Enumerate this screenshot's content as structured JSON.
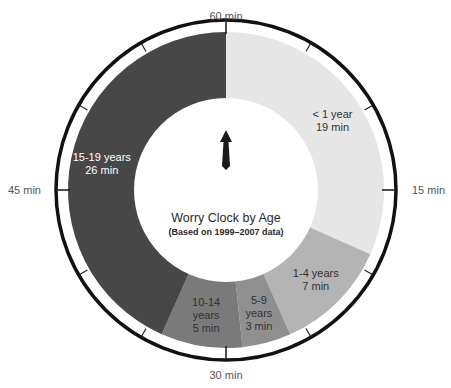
{
  "chart_data": {
    "type": "pie",
    "title": "Worry Clock by Age",
    "subtitle": "(Based on 1999–2007 data)",
    "unit": "min",
    "total": 60,
    "categories": [
      "< 1 year",
      "1-4 years",
      "5-9 years",
      "10-14 years",
      "15-19 years"
    ],
    "values": [
      19,
      7,
      3,
      5,
      26
    ],
    "colors": [
      "#e6e6e6",
      "#b4b4b4",
      "#8f8f8f",
      "#7a7a7a",
      "#474747"
    ],
    "label_colors": [
      "#333333",
      "#333333",
      "#333333",
      "#333333",
      "#ffffff"
    ],
    "label_lines": [
      [
        "< 1 year",
        "19 min"
      ],
      [
        "1-4 years",
        "7 min"
      ],
      [
        "5-9",
        "years",
        "3 min"
      ],
      [
        "10-14",
        "years",
        "5 min"
      ],
      [
        "15-19 years",
        "26 min"
      ]
    ],
    "clock_ticks": [
      {
        "minute": 0,
        "label": "60 min"
      },
      {
        "minute": 15,
        "label": "15 min"
      },
      {
        "minute": 30,
        "label": "30 min"
      },
      {
        "minute": 45,
        "label": "45 min"
      }
    ],
    "minor_tick_interval_min": 5,
    "hand_position_min": 0,
    "legend": "none",
    "grid": false
  }
}
